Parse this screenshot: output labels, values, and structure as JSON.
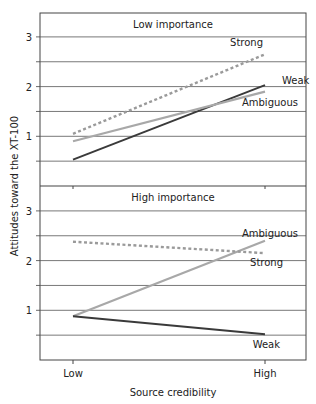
{
  "chart_data": {
    "type": "line",
    "ylabel": "Attitudes toward the XT-100",
    "xlabel": "Source credibility",
    "categories": [
      "Low",
      "High"
    ],
    "yticks": [
      "3",
      "2",
      "1"
    ],
    "ylim": [
      0,
      3.5
    ],
    "grid": true,
    "panels": [
      {
        "title": "Low importance",
        "series": [
          {
            "name": "Strong",
            "values": [
              1.05,
              2.65
            ],
            "style": "dotted",
            "color": "#9a9a9a"
          },
          {
            "name": "Weak",
            "values": [
              0.53,
              2.03
            ],
            "style": "solid",
            "color": "#3a3a3a"
          },
          {
            "name": "Ambiguous",
            "values": [
              0.9,
              1.9
            ],
            "style": "solid",
            "color": "#a8a8a8"
          }
        ]
      },
      {
        "title": "High importance",
        "series": [
          {
            "name": "Ambiguous",
            "values": [
              0.88,
              2.4
            ],
            "style": "solid",
            "color": "#a8a8a8"
          },
          {
            "name": "Strong",
            "values": [
              2.38,
              2.15
            ],
            "style": "dotted",
            "color": "#9a9a9a"
          },
          {
            "name": "Weak",
            "values": [
              0.88,
              0.52
            ],
            "style": "solid",
            "color": "#3a3a3a"
          }
        ]
      }
    ]
  }
}
